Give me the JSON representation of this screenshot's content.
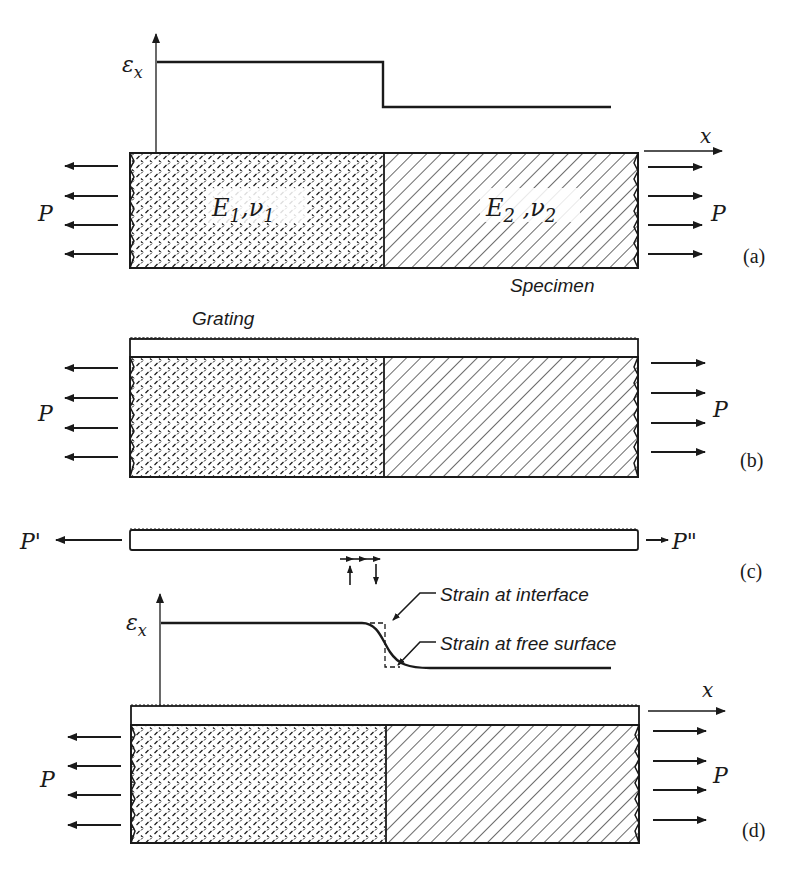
{
  "figure": {
    "panels": [
      {
        "id": "a",
        "label": "(a)",
        "axis_y_label": "ε",
        "axis_y_sub": "x",
        "axis_x_label": "x",
        "load_left": "P",
        "load_right": "P",
        "material_1": {
          "E": "E",
          "E_sub": "1",
          "nu": "ν",
          "nu_sub": "1"
        },
        "material_2": {
          "E": "E",
          "E_sub": "2",
          "nu": "ν",
          "nu_sub": "2"
        },
        "specimen_label": "Specimen",
        "strain_profile": "step"
      },
      {
        "id": "b",
        "label": "(b)",
        "grating_label": "Grating",
        "load_left": "P",
        "load_right": "P"
      },
      {
        "id": "c",
        "label": "(c)",
        "load_left": "P'",
        "load_right": "P\""
      },
      {
        "id": "d",
        "label": "(d)",
        "axis_y_label": "ε",
        "axis_y_sub": "x",
        "axis_x_label": "x",
        "load_left": "P",
        "load_right": "P",
        "annotation_interface": "Strain at interface",
        "annotation_surface": "Strain at free surface",
        "strain_profile": "smooth"
      }
    ],
    "colors": {
      "ink": "#1a1a1a",
      "background": "#ffffff"
    }
  }
}
